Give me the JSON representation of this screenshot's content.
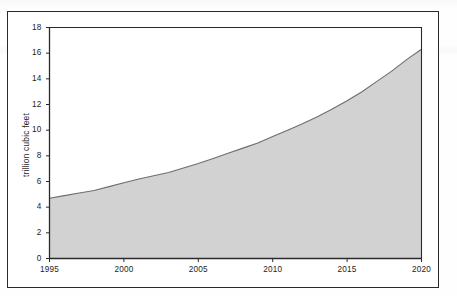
{
  "figure": {
    "background_color": "#ffffff",
    "frame_color": "#2a2a2a"
  },
  "chart_data": {
    "type": "area",
    "title": "",
    "subtitle": "",
    "xlabel": "",
    "ylabel": "trillion cubic feet",
    "x": [
      1995,
      1996,
      1997,
      1998,
      1999,
      2000,
      2001,
      2002,
      2003,
      2004,
      2005,
      2006,
      2007,
      2008,
      2009,
      2010,
      2011,
      2012,
      2013,
      2014,
      2015,
      2016,
      2017,
      2018,
      2019,
      2020
    ],
    "values": [
      4.7,
      4.9,
      5.1,
      5.3,
      5.6,
      5.9,
      6.2,
      6.45,
      6.7,
      7.05,
      7.4,
      7.8,
      8.2,
      8.6,
      9.0,
      9.5,
      10.0,
      10.5,
      11.05,
      11.65,
      12.3,
      13.0,
      13.8,
      14.6,
      15.5,
      16.3
    ],
    "series": [
      {
        "name": "trillion cubic feet",
        "values": [
          4.7,
          4.9,
          5.1,
          5.3,
          5.6,
          5.9,
          6.2,
          6.45,
          6.7,
          7.05,
          7.4,
          7.8,
          8.2,
          8.6,
          9.0,
          9.5,
          10.0,
          10.5,
          11.05,
          11.65,
          12.3,
          13.0,
          13.8,
          14.6,
          15.5,
          16.3
        ],
        "fill_color": "#d2d2d2",
        "line_color": "#6d6d6d"
      }
    ],
    "xlim": [
      1995,
      2020
    ],
    "ylim": [
      0,
      18
    ],
    "y_ticks": [
      0,
      2,
      4,
      6,
      8,
      10,
      12,
      14,
      16,
      18
    ],
    "y_tick_labels": [
      "0",
      "2",
      "4",
      "6",
      "8",
      "10",
      "12",
      "14",
      "16",
      "18"
    ],
    "x_ticks": [
      1995,
      2000,
      2005,
      2010,
      2015,
      2020
    ],
    "x_tick_labels": [
      "1995",
      "2000",
      "2005",
      "2010",
      "2015",
      "2020"
    ],
    "grid": false,
    "legend": null,
    "legend_position": "none",
    "annotations": []
  }
}
